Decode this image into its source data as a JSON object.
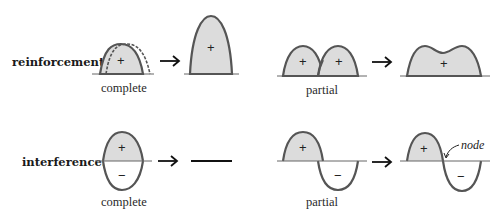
{
  "diagram": {
    "colors": {
      "fill": "#dcdcdc",
      "stroke": "#555555",
      "text": "#1a1a1a"
    },
    "rows": [
      {
        "label": "reinforcement:",
        "panels": [
          {
            "caption": "complete",
            "before_signs": [
              "+"
            ],
            "after_signs": [
              "+"
            ]
          },
          {
            "caption": "partial",
            "before_signs": [
              "+",
              "+"
            ],
            "after_signs": [
              "+"
            ]
          }
        ]
      },
      {
        "label": "interference:",
        "panels": [
          {
            "caption": "complete",
            "before_signs": [
              "+",
              "−"
            ],
            "after_signs": []
          },
          {
            "caption": "partial",
            "before_signs": [
              "+",
              "−"
            ],
            "after_signs": [
              "+",
              "−"
            ],
            "annotation": "node"
          }
        ]
      }
    ],
    "arrow_glyph": "right-arrow"
  }
}
